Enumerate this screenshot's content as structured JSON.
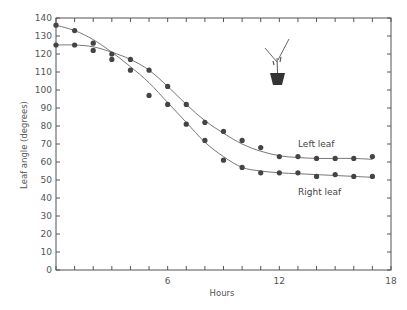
{
  "chart_data": {
    "type": "scatter",
    "title": "",
    "xlabel": "Hours",
    "ylabel": "Leaf angle (degrees)",
    "xlim": [
      0,
      18
    ],
    "ylim": [
      0,
      140
    ],
    "xticks": [
      0,
      1,
      2,
      3,
      4,
      5,
      6,
      7,
      8,
      9,
      10,
      11,
      12,
      13,
      14,
      15,
      16,
      17,
      18
    ],
    "xtick_labels": [
      "6",
      "12",
      "18"
    ],
    "xtick_label_values": [
      6,
      12,
      18
    ],
    "yticks": [
      0,
      10,
      20,
      30,
      40,
      50,
      60,
      70,
      80,
      90,
      100,
      110,
      120,
      130,
      140
    ],
    "ytick_labels": [
      "0",
      "10",
      "20",
      "30",
      "40",
      "50",
      "60",
      "70",
      "80",
      "90",
      "100",
      "110",
      "120",
      "130",
      "140"
    ],
    "grid": false,
    "legend": "inline labels near curve ends",
    "series": [
      {
        "name": "Left leaf",
        "x": [
          0,
          1,
          2,
          3,
          4,
          5,
          6,
          7,
          8,
          9,
          10,
          11,
          12,
          13,
          14,
          15,
          16,
          17
        ],
        "values": [
          125,
          125,
          122,
          120,
          117,
          111,
          102,
          92,
          82,
          77,
          72,
          68,
          63,
          63,
          62,
          62,
          62,
          63
        ],
        "fitted_curve": [
          [
            0,
            125
          ],
          [
            1,
            125
          ],
          [
            2,
            124
          ],
          [
            3,
            121
          ],
          [
            4,
            117
          ],
          [
            5,
            111
          ],
          [
            6,
            102
          ],
          [
            7,
            92
          ],
          [
            8,
            83
          ],
          [
            9,
            76
          ],
          [
            10,
            70
          ],
          [
            11,
            66
          ],
          [
            12,
            63.5
          ],
          [
            13,
            62.5
          ],
          [
            14,
            62
          ],
          [
            15,
            62
          ],
          [
            16,
            62
          ],
          [
            17,
            61.5
          ]
        ]
      },
      {
        "name": "Right leaf",
        "x": [
          0,
          1,
          2,
          3,
          4,
          5,
          6,
          7,
          8,
          9,
          10,
          11,
          12,
          13,
          14,
          15,
          16,
          17
        ],
        "values": [
          136,
          133,
          126,
          117,
          111,
          97,
          92,
          81,
          72,
          61,
          57,
          54,
          54,
          54,
          52,
          53,
          52,
          52
        ],
        "fitted_curve": [
          [
            0,
            136
          ],
          [
            1,
            133
          ],
          [
            2,
            128
          ],
          [
            3,
            121
          ],
          [
            4,
            113
          ],
          [
            5,
            104
          ],
          [
            6,
            93
          ],
          [
            7,
            82
          ],
          [
            8,
            71
          ],
          [
            9,
            63
          ],
          [
            10,
            57
          ],
          [
            11,
            55
          ],
          [
            12,
            54
          ],
          [
            13,
            53.5
          ],
          [
            14,
            53
          ],
          [
            15,
            52.5
          ],
          [
            16,
            52
          ],
          [
            17,
            51.5
          ]
        ]
      }
    ],
    "annotations": [
      "Plant-in-pot icon with two leaves (top right)"
    ]
  },
  "labels": {
    "xlabel": "Hours",
    "ylabel": "Leaf angle (degrees)",
    "left_leaf": "Left leaf",
    "right_leaf": "Right leaf"
  },
  "colors": {
    "axis": "#555555",
    "curve": "#777777",
    "points": "#444444"
  }
}
